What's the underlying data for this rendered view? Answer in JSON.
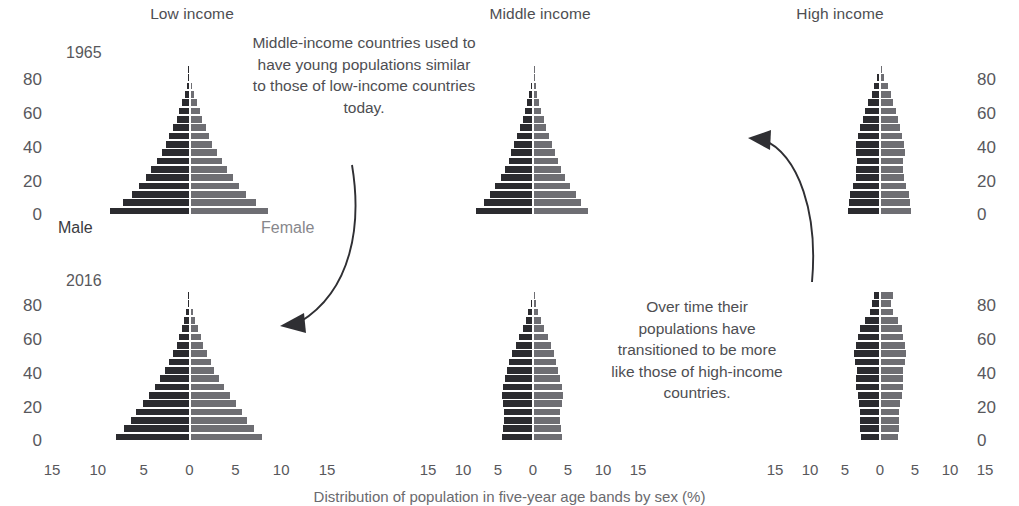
{
  "columns": [
    {
      "key": "low",
      "label": "Low income"
    },
    {
      "key": "middle",
      "label": "Middle income"
    },
    {
      "key": "high",
      "label": "High income"
    }
  ],
  "rows": [
    {
      "key": "y1965",
      "label": "1965"
    },
    {
      "key": "y2016",
      "label": "2016"
    }
  ],
  "legend": {
    "male": "Male",
    "female": "Female"
  },
  "axes": {
    "y_ticks": [
      "80",
      "60",
      "40",
      "20",
      "0"
    ],
    "x_ticks": [
      "15",
      "10",
      "5",
      "0",
      "5",
      "10",
      "15"
    ],
    "x_max": 15,
    "y_label_unit": "age",
    "caption": "Distribution of population in five-year age bands by sex (%)"
  },
  "annotations": [
    {
      "id": "anno-middle-to-low",
      "text": "Middle-income countries used to have young populations similar to those of low-income countries today."
    },
    {
      "id": "anno-middle-to-high",
      "text": "Over time their populations have transitioned to be more like those of high-income countries."
    }
  ],
  "chart_data": {
    "type": "bar",
    "title": "Distribution of population in five-year age bands by sex (%)",
    "xlabel": "Distribution of population in five-year age bands by sex (%)",
    "ylabel": "age",
    "xlim": [
      -15,
      15
    ],
    "ylim": [
      0,
      85
    ],
    "grid": false,
    "legend_position": "inside-bottom",
    "age_bands": [
      "0-4",
      "5-9",
      "10-14",
      "15-19",
      "20-24",
      "25-29",
      "30-34",
      "35-39",
      "40-44",
      "45-49",
      "50-54",
      "55-59",
      "60-64",
      "65-69",
      "70-74",
      "75-79",
      "80-84",
      "85+"
    ],
    "panels": [
      {
        "column": "Low income",
        "row": "1965",
        "series": [
          {
            "name": "Male",
            "values": [
              8.7,
              7.3,
              6.3,
              5.5,
              4.8,
              4.2,
              3.6,
              3.0,
              2.6,
              2.2,
              1.8,
              1.4,
              1.1,
              0.8,
              0.5,
              0.3,
              0.15,
              0.07
            ]
          },
          {
            "name": "Female",
            "values": [
              8.6,
              7.2,
              6.2,
              5.4,
              4.7,
              4.1,
              3.5,
              3.0,
              2.5,
              2.1,
              1.8,
              1.4,
              1.1,
              0.8,
              0.5,
              0.3,
              0.15,
              0.07
            ]
          }
        ]
      },
      {
        "column": "Low income",
        "row": "2016",
        "series": [
          {
            "name": "Male",
            "values": [
              8.0,
              7.1,
              6.4,
              5.8,
              5.1,
              4.4,
              3.8,
              3.2,
              2.7,
              2.2,
              1.8,
              1.4,
              1.1,
              0.8,
              0.55,
              0.33,
              0.16,
              0.07
            ]
          },
          {
            "name": "Female",
            "values": [
              7.9,
              7.0,
              6.3,
              5.7,
              5.1,
              4.4,
              3.8,
              3.2,
              2.7,
              2.3,
              1.9,
              1.5,
              1.2,
              0.9,
              0.6,
              0.36,
              0.18,
              0.08
            ]
          }
        ]
      },
      {
        "column": "Middle income",
        "row": "1965",
        "series": [
          {
            "name": "Male",
            "values": [
              8.1,
              7.0,
              6.2,
              5.4,
              4.6,
              4.0,
              3.5,
              3.1,
              2.7,
              2.3,
              1.9,
              1.5,
              1.2,
              0.9,
              0.6,
              0.35,
              0.16,
              0.06
            ]
          },
          {
            "name": "Female",
            "values": [
              7.9,
              6.8,
              6.1,
              5.3,
              4.6,
              4.0,
              3.5,
              3.1,
              2.7,
              2.3,
              1.9,
              1.6,
              1.2,
              0.9,
              0.6,
              0.37,
              0.18,
              0.07
            ]
          }
        ]
      },
      {
        "column": "Middle income",
        "row": "2016",
        "series": [
          {
            "name": "Male",
            "values": [
              4.4,
              4.3,
              4.2,
              4.1,
              4.3,
              4.5,
              4.3,
              4.0,
              3.7,
              3.4,
              3.0,
              2.5,
              2.0,
              1.5,
              1.0,
              0.65,
              0.35,
              0.15
            ]
          },
          {
            "name": "Female",
            "values": [
              4.1,
              4.0,
              3.9,
              3.9,
              4.1,
              4.3,
              4.2,
              3.9,
              3.6,
              3.3,
              3.0,
              2.5,
              2.1,
              1.6,
              1.1,
              0.75,
              0.45,
              0.22
            ]
          }
        ]
      },
      {
        "column": "High income",
        "row": "1965",
        "series": [
          {
            "name": "Male",
            "values": [
              4.6,
              4.5,
              4.3,
              3.9,
              3.5,
              3.4,
              3.3,
              3.5,
              3.4,
              3.1,
              2.8,
              2.5,
              2.1,
              1.7,
              1.2,
              0.8,
              0.4,
              0.15
            ]
          },
          {
            "name": "Female",
            "values": [
              4.4,
              4.3,
              4.1,
              3.7,
              3.4,
              3.3,
              3.3,
              3.5,
              3.4,
              3.2,
              2.9,
              2.6,
              2.3,
              1.9,
              1.5,
              1.1,
              0.6,
              0.25
            ]
          }
        ]
      },
      {
        "column": "High income",
        "row": "2016",
        "series": [
          {
            "name": "Male",
            "values": [
              2.7,
              2.8,
              2.8,
              2.8,
              3.0,
              3.2,
              3.4,
              3.4,
              3.3,
              3.6,
              3.7,
              3.5,
              3.2,
              2.9,
              2.2,
              1.5,
              1.1,
              0.9
            ]
          },
          {
            "name": "Female",
            "values": [
              2.6,
              2.7,
              2.7,
              2.7,
              2.9,
              3.1,
              3.3,
              3.3,
              3.3,
              3.6,
              3.7,
              3.6,
              3.3,
              3.1,
              2.5,
              1.9,
              1.6,
              1.9
            ]
          }
        ]
      }
    ]
  }
}
